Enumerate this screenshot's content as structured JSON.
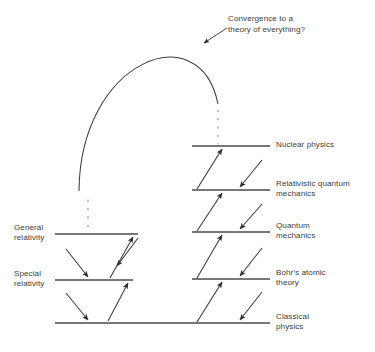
{
  "figure": {
    "background_color": "#ffffff",
    "line_color": "#4a4a4a",
    "text_color": "#3c3c3c",
    "annotation": {
      "text": "Convergence to a\ntheory of everything?",
      "x": 228,
      "y": 14
    }
  },
  "levels_right": [
    {
      "id": "nuclear-physics",
      "label": "Nuclear physics",
      "y": 146,
      "x1": 192,
      "x2": 270,
      "label_x": 276,
      "label_y": 140
    },
    {
      "id": "relativistic-quantum-mechanics",
      "label": "Relativistic quantum\nmechanics",
      "y": 190,
      "x1": 192,
      "x2": 270,
      "label_x": 276,
      "label_y": 179
    },
    {
      "id": "quantum-mechanics",
      "label": "Quantum\nmechanics",
      "y": 232,
      "x1": 192,
      "x2": 270,
      "label_x": 276,
      "label_y": 221
    },
    {
      "id": "bohrs-atomic-theory",
      "label": "Bohr's atomic\ntheory",
      "y": 279,
      "x1": 192,
      "x2": 270,
      "label_x": 276,
      "label_y": 268
    },
    {
      "id": "classical-physics",
      "label": "Classical\nphysics",
      "y": 323,
      "x1": 55,
      "x2": 270,
      "label_x": 276,
      "label_y": 312
    }
  ],
  "levels_left": [
    {
      "id": "general-relativity",
      "label": "General\nrelativity",
      "y": 234,
      "x1": 55,
      "x2": 138,
      "label_x": 14,
      "label_y": 223
    },
    {
      "id": "special-relativity",
      "label": "Special\nrelativity",
      "y": 280,
      "x1": 55,
      "x2": 133,
      "label_x": 14,
      "label_y": 269
    }
  ],
  "dotted_continuations": [
    {
      "id": "dotted-left",
      "x": 88,
      "y1": 200,
      "y2": 232
    },
    {
      "id": "dotted-right",
      "x": 218,
      "y1": 110,
      "y2": 144
    }
  ],
  "convergence_arc": {
    "id": "convergence-arc",
    "start_x": 79,
    "start_y": 191,
    "c1_x": 80,
    "c1_y": 60,
    "c2_x": 200,
    "c2_y": 14,
    "end_x": 218,
    "end_y": 104
  },
  "callout_arrow": {
    "id": "convergence-callout",
    "from_x": 227,
    "from_y": 28,
    "to_x": 204,
    "to_y": 43
  },
  "arrows_right_up": [
    {
      "id": "arrow-up-classical-to-bohr",
      "x1": 197,
      "y1": 322,
      "x2": 222,
      "y2": 282
    },
    {
      "id": "arrow-up-bohr-to-quantum",
      "x1": 197,
      "y1": 278,
      "x2": 222,
      "y2": 235
    },
    {
      "id": "arrow-up-quantum-to-relativistic",
      "x1": 197,
      "y1": 231,
      "x2": 222,
      "y2": 193
    },
    {
      "id": "arrow-up-relativistic-to-nuclear",
      "x1": 197,
      "y1": 189,
      "x2": 222,
      "y2": 149
    }
  ],
  "arrows_right_down": [
    {
      "id": "arrow-down-nuclear-to-relativistic",
      "x1": 262,
      "y1": 160,
      "x2": 240,
      "y2": 187
    },
    {
      "id": "arrow-down-relativistic-to-quantum",
      "x1": 262,
      "y1": 204,
      "x2": 240,
      "y2": 229
    },
    {
      "id": "arrow-down-quantum-to-bohr",
      "x1": 262,
      "y1": 248,
      "x2": 240,
      "y2": 276
    },
    {
      "id": "arrow-down-bohr-to-classical",
      "x1": 262,
      "y1": 292,
      "x2": 240,
      "y2": 320
    }
  ],
  "arrows_left_up": [
    {
      "id": "arrow-up-classical-to-special",
      "x1": 108,
      "y1": 321,
      "x2": 128,
      "y2": 283
    },
    {
      "id": "arrow-up-special-to-general",
      "x1": 110,
      "y1": 278,
      "x2": 133,
      "y2": 237
    }
  ],
  "arrows_left_down": [
    {
      "id": "arrow-down-general-to-special",
      "x1": 66,
      "y1": 249,
      "x2": 88,
      "y2": 277
    },
    {
      "id": "arrow-down-special-to-classical",
      "x1": 66,
      "y1": 293,
      "x2": 88,
      "y2": 320
    },
    {
      "id": "arrow-down-general-right-to-special",
      "x1": 138,
      "y1": 238,
      "x2": 117,
      "y2": 266
    }
  ]
}
